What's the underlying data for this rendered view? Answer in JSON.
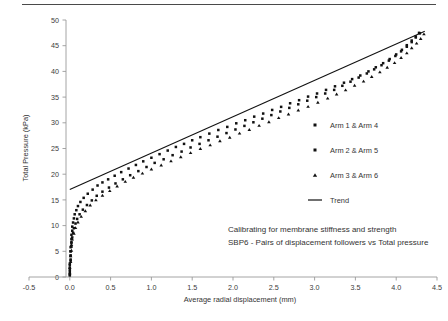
{
  "chart_data": {
    "type": "scatter",
    "title": "",
    "xlabel": "Average radial displacement (mm)",
    "ylabel": "Total Pressure (kPa)",
    "xlim": [
      -0.5,
      4.5
    ],
    "ylim": [
      0,
      50
    ],
    "xticks": [
      "-0.5",
      "0.0",
      "0.5",
      "1.0",
      "1.5",
      "2.0",
      "2.5",
      "3.0",
      "3.5",
      "4.0",
      "4.5"
    ],
    "xtick_values": [
      -0.5,
      0.0,
      0.5,
      1.0,
      1.5,
      2.0,
      2.5,
      3.0,
      3.5,
      4.0,
      4.5
    ],
    "yticks": [
      "0",
      "5",
      "10",
      "15",
      "20",
      "25",
      "30",
      "35",
      "40",
      "45",
      "50"
    ],
    "ytick_values": [
      0,
      5,
      10,
      15,
      20,
      25,
      30,
      35,
      40,
      45,
      50
    ],
    "grid": false,
    "legend_position": "center-right",
    "caption_lines": [
      "Calibrating for membrane stiffness and strength",
      "SBP6 - Pairs of displacement followers vs Total pressure"
    ],
    "series": [
      {
        "name": "Arm 1 & Arm 4",
        "marker": "square",
        "color": "#111111",
        "points": [
          [
            0.0,
            0.3
          ],
          [
            0.0,
            1.0
          ],
          [
            0.0,
            1.8
          ],
          [
            0.0,
            2.6
          ],
          [
            0.01,
            3.4
          ],
          [
            0.01,
            4.2
          ],
          [
            0.01,
            5.0
          ],
          [
            0.01,
            5.8
          ],
          [
            0.02,
            6.6
          ],
          [
            0.02,
            7.4
          ],
          [
            0.02,
            8.2
          ],
          [
            0.03,
            9.0
          ],
          [
            0.03,
            9.8
          ],
          [
            0.04,
            10.6
          ],
          [
            0.05,
            11.4
          ],
          [
            0.06,
            12.2
          ],
          [
            0.08,
            13.0
          ],
          [
            0.1,
            13.8
          ],
          [
            0.13,
            14.6
          ],
          [
            0.17,
            15.4
          ],
          [
            0.22,
            16.2
          ],
          [
            0.28,
            17.0
          ],
          [
            0.34,
            17.8
          ],
          [
            0.4,
            18.4
          ],
          [
            0.47,
            19.0
          ],
          [
            0.55,
            19.7
          ],
          [
            0.63,
            20.4
          ],
          [
            0.72,
            21.1
          ],
          [
            0.81,
            21.8
          ],
          [
            0.9,
            22.5
          ],
          [
            1.0,
            23.2
          ],
          [
            1.1,
            23.9
          ],
          [
            1.2,
            24.6
          ],
          [
            1.3,
            25.3
          ],
          [
            1.4,
            25.9
          ],
          [
            1.5,
            26.6
          ],
          [
            1.6,
            27.2
          ],
          [
            1.71,
            27.9
          ],
          [
            1.82,
            28.6
          ],
          [
            1.93,
            29.2
          ],
          [
            2.04,
            29.9
          ],
          [
            2.15,
            30.5
          ],
          [
            2.26,
            31.2
          ],
          [
            2.37,
            31.8
          ],
          [
            2.48,
            32.5
          ],
          [
            2.59,
            33.1
          ],
          [
            2.7,
            33.8
          ],
          [
            2.81,
            34.4
          ],
          [
            2.92,
            35.1
          ],
          [
            3.03,
            35.7
          ],
          [
            3.14,
            36.4
          ],
          [
            3.25,
            37.1
          ],
          [
            3.36,
            37.8
          ],
          [
            3.46,
            38.5
          ],
          [
            3.56,
            39.2
          ],
          [
            3.66,
            40.0
          ],
          [
            3.75,
            40.8
          ],
          [
            3.84,
            41.6
          ],
          [
            3.92,
            42.4
          ],
          [
            4.0,
            43.3
          ],
          [
            4.07,
            44.2
          ],
          [
            4.13,
            45.1
          ],
          [
            4.19,
            46.0
          ],
          [
            4.24,
            46.8
          ],
          [
            4.28,
            47.5
          ]
        ]
      },
      {
        "name": "Arm 2 & Arm 5",
        "marker": "square",
        "color": "#111111",
        "points": [
          [
            0.0,
            0.5
          ],
          [
            0.0,
            1.4
          ],
          [
            0.0,
            2.3
          ],
          [
            0.01,
            3.2
          ],
          [
            0.01,
            4.1
          ],
          [
            0.01,
            5.0
          ],
          [
            0.02,
            5.9
          ],
          [
            0.02,
            6.8
          ],
          [
            0.03,
            7.7
          ],
          [
            0.04,
            8.6
          ],
          [
            0.05,
            9.5
          ],
          [
            0.07,
            10.4
          ],
          [
            0.09,
            11.3
          ],
          [
            0.12,
            12.2
          ],
          [
            0.16,
            13.1
          ],
          [
            0.21,
            14.0
          ],
          [
            0.27,
            14.9
          ],
          [
            0.33,
            15.8
          ],
          [
            0.4,
            16.6
          ],
          [
            0.48,
            17.4
          ],
          [
            0.56,
            18.2
          ],
          [
            0.65,
            19.0
          ],
          [
            0.74,
            19.8
          ],
          [
            0.84,
            20.6
          ],
          [
            0.94,
            21.4
          ],
          [
            1.04,
            22.2
          ],
          [
            1.15,
            22.9
          ],
          [
            1.26,
            23.7
          ],
          [
            1.37,
            24.4
          ],
          [
            1.48,
            25.2
          ],
          [
            1.59,
            25.9
          ],
          [
            1.7,
            26.6
          ],
          [
            1.81,
            27.3
          ],
          [
            1.92,
            28.0
          ],
          [
            2.03,
            28.7
          ],
          [
            2.14,
            29.4
          ],
          [
            2.25,
            30.1
          ],
          [
            2.36,
            30.8
          ],
          [
            2.47,
            31.5
          ],
          [
            2.58,
            32.2
          ],
          [
            2.69,
            32.9
          ],
          [
            2.8,
            33.6
          ],
          [
            2.91,
            34.3
          ],
          [
            3.02,
            35.0
          ],
          [
            3.13,
            35.7
          ],
          [
            3.24,
            36.4
          ],
          [
            3.34,
            37.2
          ],
          [
            3.44,
            38.0
          ],
          [
            3.54,
            38.8
          ],
          [
            3.64,
            39.6
          ],
          [
            3.73,
            40.4
          ],
          [
            3.82,
            41.2
          ],
          [
            3.91,
            42.1
          ],
          [
            3.99,
            43.0
          ],
          [
            4.06,
            43.9
          ],
          [
            4.13,
            44.8
          ],
          [
            4.19,
            45.7
          ],
          [
            4.24,
            46.6
          ],
          [
            4.29,
            47.4
          ]
        ]
      },
      {
        "name": "Arm 3 & Arm 6",
        "marker": "triangle",
        "color": "#111111",
        "points": [
          [
            0.0,
            0.8
          ],
          [
            0.0,
            1.9
          ],
          [
            0.01,
            3.0
          ],
          [
            0.01,
            4.1
          ],
          [
            0.02,
            5.2
          ],
          [
            0.02,
            6.3
          ],
          [
            0.03,
            7.4
          ],
          [
            0.05,
            8.5
          ],
          [
            0.07,
            9.6
          ],
          [
            0.1,
            10.7
          ],
          [
            0.14,
            11.8
          ],
          [
            0.19,
            12.9
          ],
          [
            0.25,
            14.0
          ],
          [
            0.32,
            15.0
          ],
          [
            0.4,
            15.9
          ],
          [
            0.49,
            16.8
          ],
          [
            0.58,
            17.7
          ],
          [
            0.68,
            18.6
          ],
          [
            0.78,
            19.4
          ],
          [
            0.89,
            20.2
          ],
          [
            1.0,
            21.0
          ],
          [
            1.12,
            21.8
          ],
          [
            1.24,
            22.6
          ],
          [
            1.36,
            23.4
          ],
          [
            1.48,
            24.2
          ],
          [
            1.6,
            25.0
          ],
          [
            1.72,
            25.7
          ],
          [
            1.84,
            26.5
          ],
          [
            1.96,
            27.2
          ],
          [
            2.08,
            28.0
          ],
          [
            2.2,
            28.7
          ],
          [
            2.32,
            29.5
          ],
          [
            2.44,
            30.2
          ],
          [
            2.56,
            31.0
          ],
          [
            2.68,
            31.7
          ],
          [
            2.8,
            32.5
          ],
          [
            2.92,
            33.2
          ],
          [
            3.04,
            34.0
          ],
          [
            3.16,
            34.8
          ],
          [
            3.27,
            35.6
          ],
          [
            3.38,
            36.4
          ],
          [
            3.49,
            37.3
          ],
          [
            3.6,
            38.1
          ],
          [
            3.7,
            39.0
          ],
          [
            3.8,
            39.9
          ],
          [
            3.89,
            40.8
          ],
          [
            3.98,
            41.7
          ],
          [
            4.06,
            42.7
          ],
          [
            4.13,
            43.6
          ],
          [
            4.19,
            44.6
          ],
          [
            4.25,
            45.5
          ],
          [
            4.3,
            46.4
          ],
          [
            4.34,
            47.3
          ]
        ]
      }
    ],
    "trend": {
      "name": "Trend",
      "style": "solid-line",
      "color": "#111111",
      "points": [
        [
          0.0,
          17.0
        ],
        [
          4.35,
          47.8
        ]
      ]
    }
  }
}
